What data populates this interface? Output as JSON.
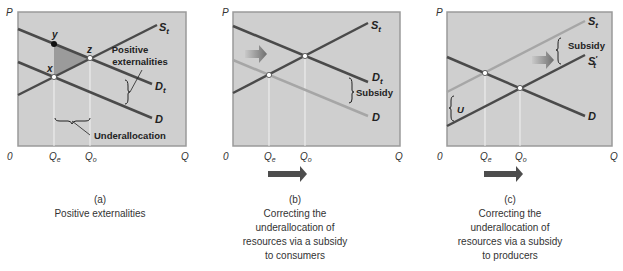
{
  "panels": [
    {
      "id": "a",
      "caption_letter": "(a)",
      "caption_lines": [
        "Positive externalities"
      ],
      "axis": {
        "y": "P",
        "x": "Q",
        "origin": "0",
        "ticks": [
          "Q",
          "Q"
        ],
        "tick_subs": [
          "e",
          "o"
        ]
      },
      "curves": {
        "supply": "S",
        "supply_sub": "t",
        "demand_total": "D",
        "demand_total_sub": "t",
        "demand": "D"
      },
      "points": {
        "y": "y",
        "z": "z",
        "x": "x"
      },
      "annotations": {
        "positive_ext_line1": "Positive",
        "positive_ext_line2": "externalities",
        "underallocation": "Underallocation"
      }
    },
    {
      "id": "b",
      "caption_letter": "(b)",
      "caption_lines": [
        "Correcting the",
        "underallocation of",
        "resources via a subsidy",
        "to consumers"
      ],
      "axis": {
        "y": "P",
        "x": "Q",
        "origin": "0",
        "ticks": [
          "Q",
          "Q"
        ],
        "tick_subs": [
          "e",
          "o"
        ]
      },
      "curves": {
        "supply": "S",
        "supply_sub": "t",
        "demand_total": "D",
        "demand_total_sub": "t",
        "demand": "D"
      },
      "annotations": {
        "subsidy": "Subsidy"
      }
    },
    {
      "id": "c",
      "caption_letter": "(c)",
      "caption_lines": [
        "Correcting the",
        "underallocation of",
        "resources via a subsidy",
        "to producers"
      ],
      "axis": {
        "y": "P",
        "x": "Q",
        "origin": "0",
        "ticks": [
          "Q",
          "Q"
        ],
        "tick_subs": [
          "e",
          "o"
        ]
      },
      "curves": {
        "supply": "S",
        "supply_sub": "t",
        "supply_new": "S",
        "supply_new_sub": "t",
        "supply_new_prime": "′",
        "demand": "D"
      },
      "annotations": {
        "subsidy": "Subsidy",
        "u": "U"
      }
    }
  ],
  "colors": {
    "panel_bg": "#cfcfcf",
    "panel_border": "#9a9a9a",
    "dark_line": "#4a4a4a",
    "light_line": "#a6a6a6",
    "shade": "#8f8f8f",
    "arrow": "#4d4d4d"
  }
}
